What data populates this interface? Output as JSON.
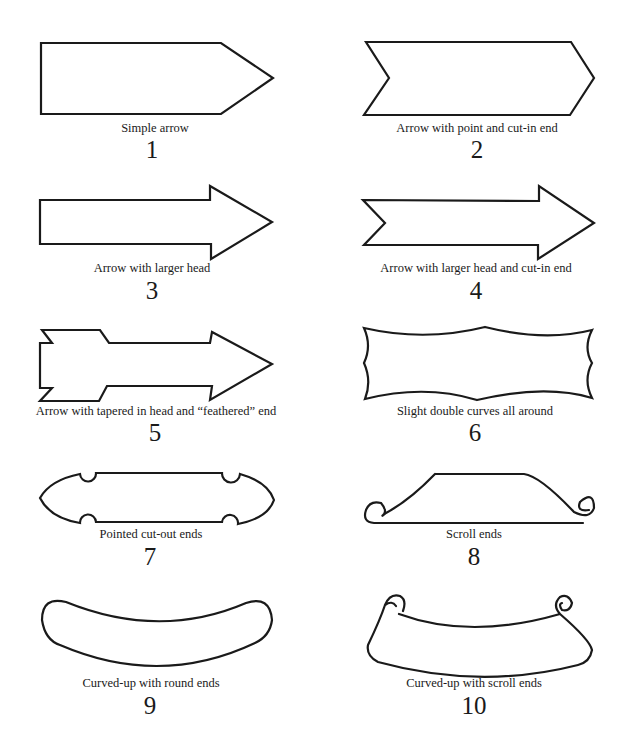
{
  "diagram": {
    "title": "",
    "items": [
      {
        "number": "1",
        "caption": "Simple arrow",
        "shape": "simple-arrow"
      },
      {
        "number": "2",
        "caption": "Arrow with point and cut-in end",
        "shape": "arrow-point-cut-in"
      },
      {
        "number": "3",
        "caption": "Arrow with larger head",
        "shape": "arrow-larger-head"
      },
      {
        "number": "4",
        "caption": "Arrow with larger head and cut-in end",
        "shape": "arrow-larger-head-cut-in"
      },
      {
        "number": "5",
        "caption": "Arrow with tapered in head and “feathered” end",
        "shape": "arrow-tapered-feathered"
      },
      {
        "number": "6",
        "caption": "Slight double curves all around",
        "shape": "double-curve-banner"
      },
      {
        "number": "7",
        "caption": "Pointed cut-out ends",
        "shape": "pointed-cutout-banner"
      },
      {
        "number": "8",
        "caption": "Scroll ends",
        "shape": "scroll-end-banner"
      },
      {
        "number": "9",
        "caption": "Curved-up with round ends",
        "shape": "curved-round-banner"
      },
      {
        "number": "10",
        "caption": "Curved-up with scroll ends",
        "shape": "curved-scroll-banner"
      }
    ],
    "stroke_color": "#1a1a1a",
    "background_color": "#ffffff"
  }
}
